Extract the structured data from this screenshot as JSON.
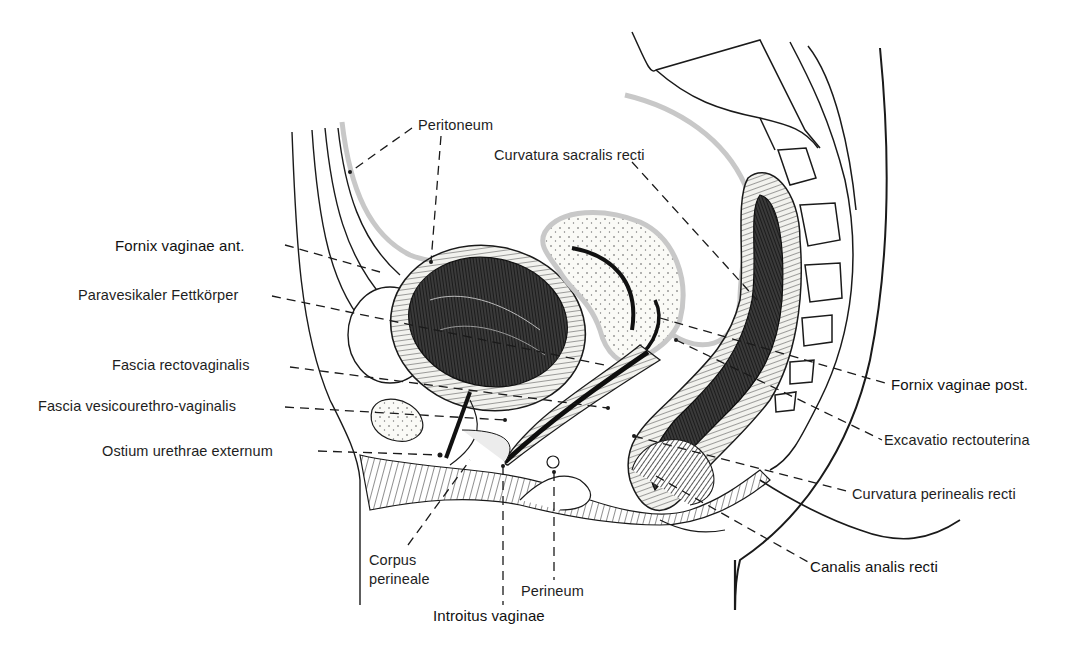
{
  "figure": {
    "colors": {
      "ink": "#1a1a1a",
      "peritoneum": "#c8c8c8",
      "tissue_fill": "#f4f4f0",
      "lumen_dark": "#222222"
    }
  },
  "labels": {
    "left": [
      {
        "id": "peritoneum",
        "text": "Peritoneum"
      },
      {
        "id": "fornix_vaginae_ant",
        "text": "Fornix vaginae ant."
      },
      {
        "id": "paravesikaler_fettkoerper",
        "text": "Paravesikaler Fettkörper"
      },
      {
        "id": "fascia_rectovaginalis",
        "text": "Fascia rectovaginalis"
      },
      {
        "id": "fascia_vesicourethro_vaginalis",
        "text": "Fascia vesicourethro-vaginalis"
      },
      {
        "id": "ostium_urethrae_externum",
        "text": "Ostium urethrae externum"
      }
    ],
    "top": [
      {
        "id": "curvatura_sacralis_recti",
        "text": "Curvatura sacralis recti"
      }
    ],
    "right": [
      {
        "id": "fornix_vaginae_post",
        "text": "Fornix vaginae post."
      },
      {
        "id": "excavatio_rectouterina",
        "text": "Excavatio rectouterina"
      },
      {
        "id": "curvatura_perinealis_recti",
        "text": "Curvatura perinealis recti"
      },
      {
        "id": "canalis_analis_recti",
        "text": "Canalis analis recti"
      }
    ],
    "bottom": [
      {
        "id": "corpus_perineale",
        "text": "Corpus\nperineale"
      },
      {
        "id": "perineum",
        "text": "Perineum"
      },
      {
        "id": "introitus_vaginae",
        "text": "Introitus vaginae"
      }
    ]
  }
}
